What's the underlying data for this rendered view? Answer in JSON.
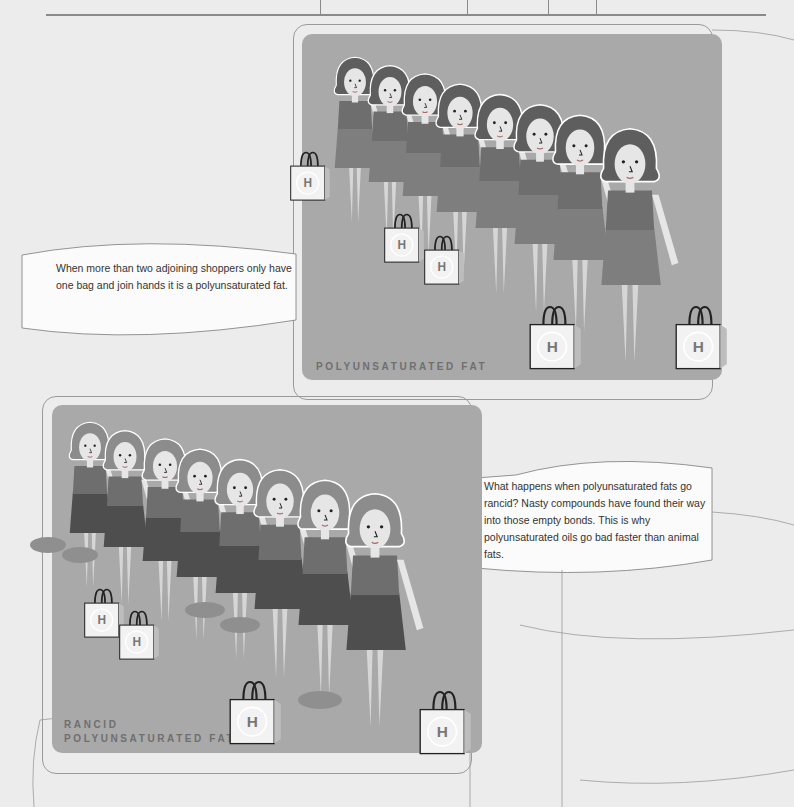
{
  "panels": [
    {
      "id": "polyunsaturated",
      "label_lines": [
        "POLYUNSATURATED FAT"
      ],
      "callout": "When more than two adjoining shoppers only have one bag and join hands it is a polyunsaturated fat.",
      "figure_count": 8,
      "bag_glyph": "H"
    },
    {
      "id": "rancid",
      "label_lines": [
        "RANCID",
        "POLYUNSATURATED FAT"
      ],
      "callout": "What happens when polyunsaturated fats go rancid? Nasty compounds have found their way into those empty bonds. This is why polyunsaturated oils go bad faster than animal fats.",
      "figure_count": 8,
      "bag_glyph": "H"
    }
  ],
  "colors": {
    "page_bg": "#ececec",
    "panel_bg": "#a9a9a9",
    "hair": "#5e5e5e",
    "hair_rancid": "#8c8c8c",
    "dress_top": "#6e6e6e",
    "dress_skirt": "#7e7e7e",
    "dress_skirt_rancid": "#4e4e4e",
    "skin": "#e6e6e6",
    "bag": "#f2f2f2",
    "rat": "#8f8f8f"
  }
}
